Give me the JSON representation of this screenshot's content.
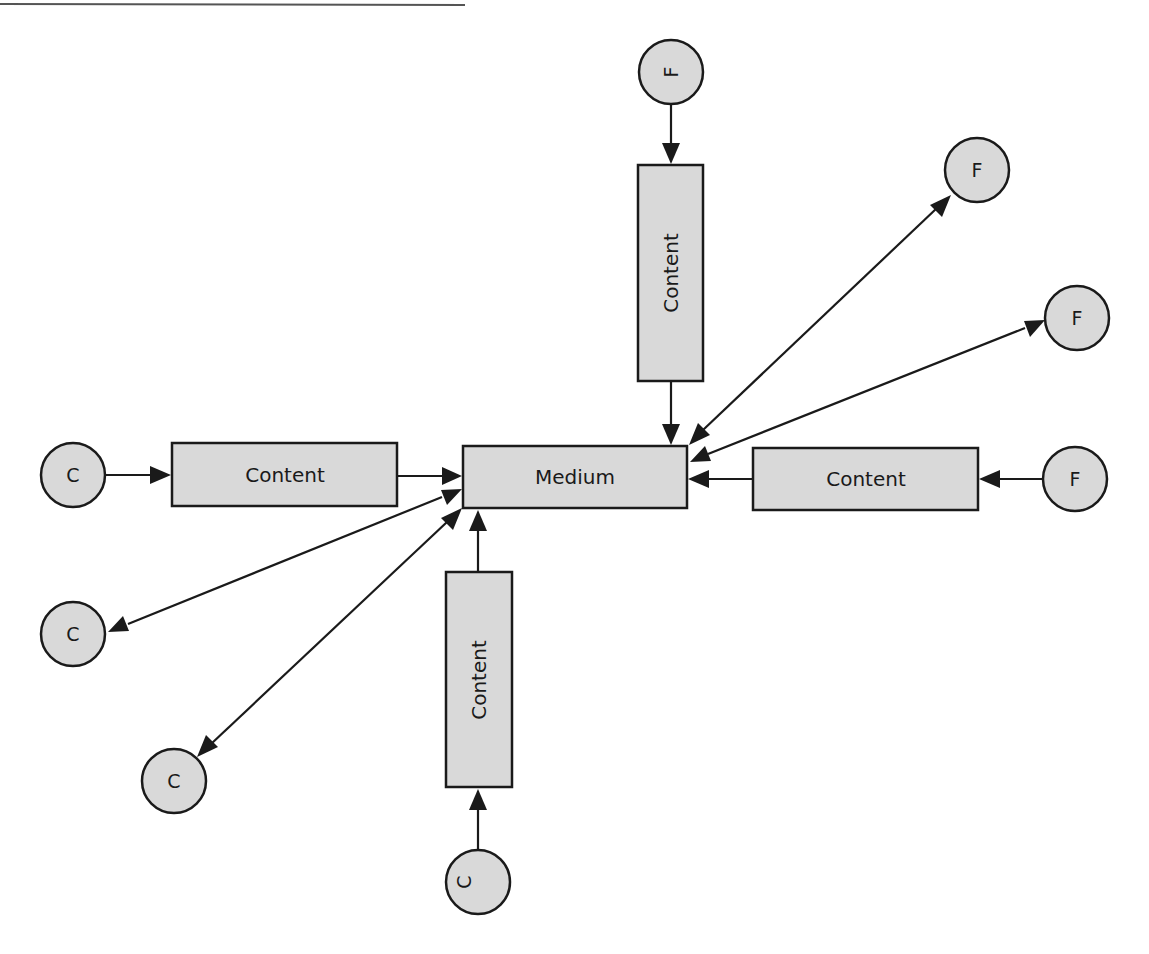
{
  "diagram": {
    "colors": {
      "node_fill": "#d9d9d9",
      "stroke": "#1a1a1a",
      "background": "#ffffff"
    },
    "center": {
      "label": "Medium"
    },
    "content_boxes": [
      {
        "id": "content-left",
        "label": "Content"
      },
      {
        "id": "content-top",
        "label": "Content"
      },
      {
        "id": "content-right",
        "label": "Content"
      },
      {
        "id": "content-bottom",
        "label": "Content"
      }
    ],
    "nodes": [
      {
        "id": "c-left",
        "label": "C"
      },
      {
        "id": "c-lower-left",
        "label": "C"
      },
      {
        "id": "c-bottom-left",
        "label": "C"
      },
      {
        "id": "c-bottom",
        "label": "C"
      },
      {
        "id": "f-top",
        "label": "F"
      },
      {
        "id": "f-upper-right",
        "label": "F"
      },
      {
        "id": "f-mid-right",
        "label": "F"
      },
      {
        "id": "f-right",
        "label": "F"
      }
    ],
    "edges": [
      {
        "from": "c-left",
        "to": "content-left"
      },
      {
        "from": "content-left",
        "to": "center"
      },
      {
        "from": "f-top",
        "to": "content-top"
      },
      {
        "from": "content-top",
        "to": "center"
      },
      {
        "from": "f-right",
        "to": "content-right"
      },
      {
        "from": "content-right",
        "to": "center"
      },
      {
        "from": "c-bottom",
        "to": "content-bottom"
      },
      {
        "from": "content-bottom",
        "to": "center"
      },
      {
        "from": "center",
        "to": "f-upper-right",
        "bidirectional": true
      },
      {
        "from": "center",
        "to": "f-mid-right",
        "bidirectional": true
      },
      {
        "from": "center",
        "to": "c-lower-left",
        "bidirectional": true
      },
      {
        "from": "center",
        "to": "c-bottom-left",
        "bidirectional": true
      }
    ]
  }
}
